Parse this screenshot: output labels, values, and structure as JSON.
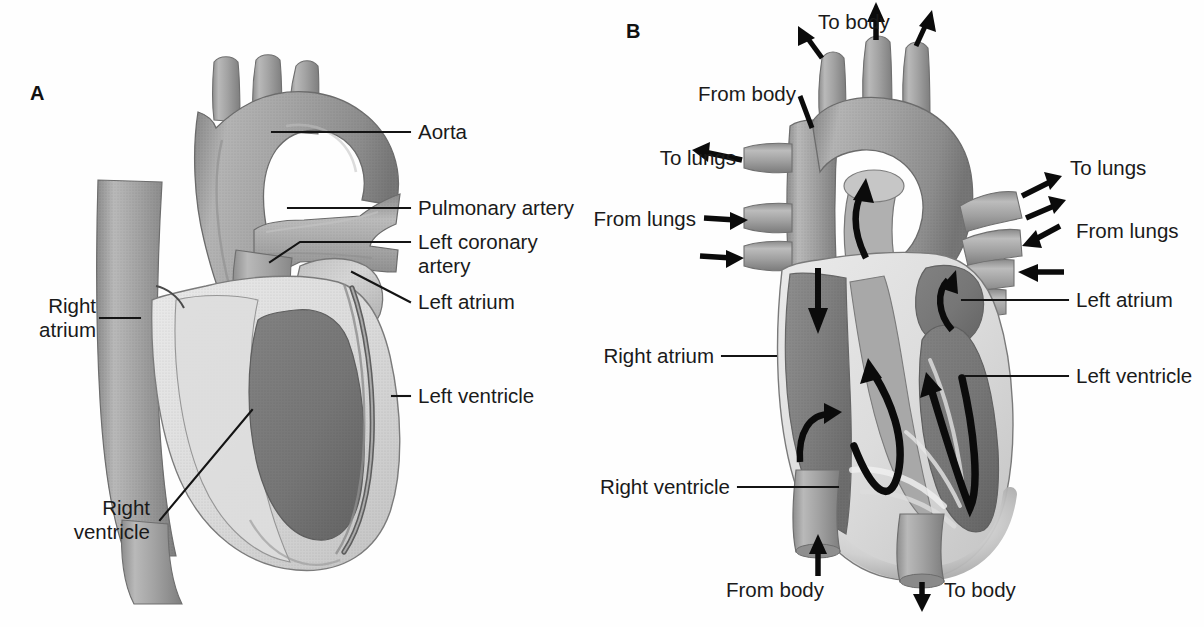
{
  "figure": {
    "background_color": "#fefefe",
    "text_color": "#1a1a1a",
    "arrow_color": "#0b0b0b"
  },
  "panels": [
    {
      "id": "A",
      "letter": "A",
      "caption_type": "external-anterior-view",
      "labels": [
        {
          "key": "aorta",
          "text": "Aorta",
          "side": "right"
        },
        {
          "key": "pulmonary_artery",
          "text": "Pulmonary artery",
          "side": "right"
        },
        {
          "key": "left_coronary_artery_line1",
          "text": "Left coronary",
          "side": "right"
        },
        {
          "key": "left_coronary_artery_line2",
          "text": "artery",
          "side": "right"
        },
        {
          "key": "left_atrium",
          "text": "Left atrium",
          "side": "right"
        },
        {
          "key": "left_ventricle",
          "text": "Left ventricle",
          "side": "right"
        },
        {
          "key": "right_atrium_line1",
          "text": "Right",
          "side": "left"
        },
        {
          "key": "right_atrium_line2",
          "text": "atrium",
          "side": "left"
        },
        {
          "key": "right_ventricle_line1",
          "text": "Right",
          "side": "left"
        },
        {
          "key": "right_ventricle_line2",
          "text": "ventricle",
          "side": "left"
        }
      ]
    },
    {
      "id": "B",
      "letter": "B",
      "caption_type": "cutaway-blood-flow-view",
      "labels": [
        {
          "key": "left_atrium",
          "text": "Left atrium",
          "side": "right"
        },
        {
          "key": "left_ventricle",
          "text": "Left ventricle",
          "side": "right"
        },
        {
          "key": "right_atrium",
          "text": "Right atrium",
          "side": "left"
        },
        {
          "key": "right_ventricle",
          "text": "Right ventricle",
          "side": "left"
        }
      ],
      "flow_labels": [
        {
          "key": "to_body_top",
          "text": "To body",
          "direction": "out",
          "position": "top-center"
        },
        {
          "key": "from_body_top",
          "text": "From body",
          "direction": "in",
          "position": "top-left"
        },
        {
          "key": "to_lungs_left",
          "text": "To lungs",
          "direction": "out",
          "position": "left-upper"
        },
        {
          "key": "from_lungs_left",
          "text": "From lungs",
          "direction": "in",
          "position": "left-lower"
        },
        {
          "key": "to_lungs_right",
          "text": "To lungs",
          "direction": "out",
          "position": "right-upper"
        },
        {
          "key": "from_lungs_right",
          "text": "From lungs",
          "direction": "in",
          "position": "right-lower"
        },
        {
          "key": "from_body_bottom",
          "text": "From body",
          "direction": "in",
          "position": "bottom-left"
        },
        {
          "key": "to_body_bottom",
          "text": "To body",
          "direction": "out",
          "position": "bottom-center"
        }
      ]
    }
  ],
  "palette": {
    "vessel_mid": "#9b9b9b",
    "vessel_light": "#b6b6b6",
    "vessel_dark": "#7c7c7c",
    "muscle_light": "#c9c9c9",
    "muscle_pale": "#e2e2e2",
    "chamber_dark": "#7a7a7a",
    "chamber_deep": "#636363",
    "outline": "#6a6a6a",
    "leader_line": "#141414"
  }
}
